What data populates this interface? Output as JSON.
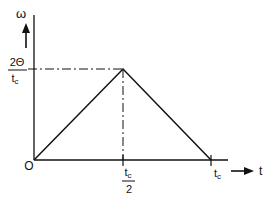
{
  "diagram": {
    "type": "triangular velocity profile",
    "colors": {
      "line": "#111111",
      "background": "#ffffff"
    },
    "y_axis": {
      "label": "ω"
    },
    "x_axis": {
      "label": "t"
    },
    "origin_label": "O",
    "peak_value_label": {
      "numerator": "2Θ",
      "denominator": "t",
      "denominator_sub": "c"
    },
    "mid_tick_label": {
      "numerator": "t",
      "numerator_sub": "c",
      "denominator": "2"
    },
    "end_tick_label": {
      "base": "t",
      "sub": "c"
    },
    "points": [
      {
        "t": "0",
        "omega": "0"
      },
      {
        "t": "t_c/2",
        "omega": "2Θ/t_c"
      },
      {
        "t": "t_c",
        "omega": "0"
      }
    ]
  }
}
